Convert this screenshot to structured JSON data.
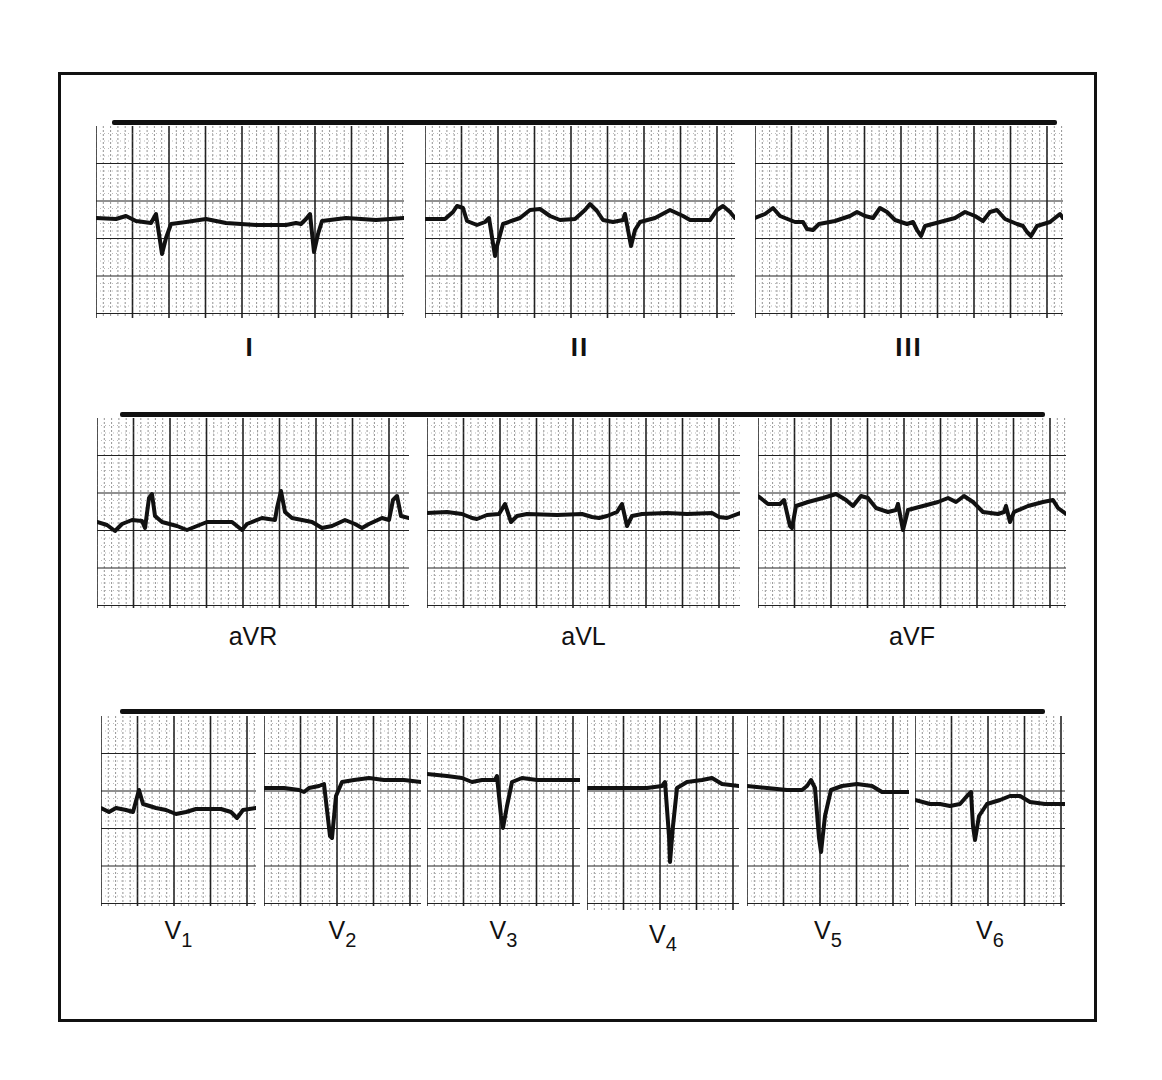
{
  "figure": {
    "rows": [
      {
        "name": "limb-leads",
        "calibration_bar": {
          "x": 112,
          "y": 120,
          "width": 945
        },
        "strips": [
          {
            "lead": "I",
            "label": "I",
            "x": 96,
            "y": 126,
            "w": 308,
            "h": 192,
            "baseline": 218,
            "waveform": "M0,92 L20,93 L30,90 L40,95 L55,97 L60,88 L66,128 L70,112 L75,98 L90,96 L110,93 L130,97 L160,99 L190,99 L200,97 L205,98 L210,93 L214,88 L218,126 L222,108 L226,95 L250,92 L280,94 L308,92"
          },
          {
            "lead": "II",
            "label": "II",
            "x": 425,
            "y": 126,
            "w": 310,
            "h": 192,
            "baseline": 218,
            "waveform": "M0,93 L20,93 L28,86 L32,80 L38,82 L42,95 L52,99 L60,96 L64,92 L70,130 L72,120 L78,98 L95,92 L105,84 L115,83 L125,90 L135,94 L150,93 L160,84 L165,78 L172,85 L178,94 L188,96 L198,94 L200,88 L206,120 L210,104 L215,96 L230,92 L245,84 L258,90 L265,94 L285,94 L292,84 L298,80 L305,86 L310,92"
          },
          {
            "lead": "III",
            "label": "III",
            "x": 755,
            "y": 126,
            "w": 308,
            "h": 192,
            "baseline": 218,
            "waveform": "M0,92 L10,88 L18,82 L25,90 L40,96 L48,96 L52,103 L58,104 L64,98 L80,95 L95,90 L102,86 L110,90 L118,92 L125,82 L132,86 L140,94 L152,98 L158,96 L162,104 L166,110 L170,100 L185,96 L200,92 L210,86 L220,90 L228,95 L235,86 L242,84 L250,93 L262,98 L268,100 L272,106 L276,110 L282,100 L295,96 L305,88 L308,92"
          }
        ]
      },
      {
        "name": "augmented-leads",
        "calibration_bar": {
          "x": 120,
          "y": 412,
          "width": 925
        },
        "strips": [
          {
            "lead": "aVR",
            "label": "aVR",
            "x": 97,
            "y": 418,
            "w": 312,
            "h": 190,
            "baseline": 525,
            "waveform": "M0,104 L10,107 L18,113 L25,106 L35,102 L45,103 L48,110 L52,80 L55,76 L58,98 L65,104 L80,108 L90,112 L100,108 L110,104 L135,104 L145,112 L150,106 L165,100 L178,102 L180,90 L184,73 L188,94 L195,100 L215,104 L225,110 L235,108 L248,102 L258,106 L265,110 L272,106 L285,100 L292,102 L296,82 L300,78 L304,98 L312,100"
          },
          {
            "lead": "aVL",
            "label": "aVL",
            "x": 427,
            "y": 418,
            "w": 313,
            "h": 190,
            "baseline": 513,
            "waveform": "M0,95 L20,94 L35,96 L45,100 L50,101 L60,97 L72,96 L78,86 L84,104 L90,98 L100,96 L130,97 L155,96 L165,99 L172,100 L180,98 L190,94 L195,86 L200,108 L205,98 L215,96 L240,95 L260,96 L285,95 L292,99 L300,100 L313,95"
          },
          {
            "lead": "aVF",
            "label": "aVF",
            "x": 758,
            "y": 418,
            "w": 308,
            "h": 190,
            "baseline": 508,
            "waveform": "M0,78 L10,86 L22,86 L26,82 L32,108 L34,110 L38,88 L50,84 L65,80 L78,76 L88,82 L95,88 L103,78 L110,80 L118,90 L130,94 L138,92 L140,86 L145,112 L150,92 L165,88 L180,84 L190,80 L198,84 L206,78 L215,84 L225,94 L240,96 L246,94 L248,88 L252,104 L256,94 L270,88 L285,84 L295,82 L300,90 L308,96"
          }
        ]
      },
      {
        "name": "precordial-leads",
        "calibration_bar": {
          "x": 120,
          "y": 709,
          "width": 925
        },
        "strips": [
          {
            "lead": "V1",
            "label": "V",
            "subscript": "1",
            "x": 101,
            "y": 716,
            "w": 155,
            "h": 190,
            "baseline": 808,
            "waveform": "M0,92 L8,96 L15,92 L25,94 L32,96 L38,74 L42,88 L55,92 L65,94 L75,98 L85,96 L95,93 L105,93 L120,93 L130,96 L136,102 L142,94 L155,92"
          },
          {
            "lead": "V2",
            "label": "V",
            "subscript": "2",
            "x": 264,
            "y": 716,
            "w": 157,
            "h": 190,
            "baseline": 788,
            "waveform": "M0,72 L20,72 L35,74 L40,76 L45,72 L55,70 L60,68 L66,120 L68,122 L72,80 L78,66 L90,64 L105,62 L120,64 L140,64 L157,66"
          },
          {
            "lead": "V3",
            "label": "V",
            "subscript": "3",
            "x": 427,
            "y": 716,
            "w": 153,
            "h": 190,
            "baseline": 775,
            "waveform": "M0,58 L20,60 L35,62 L45,66 L55,64 L68,64 L70,60 L74,100 L76,112 L80,90 L85,66 L95,62 L110,64 L130,64 L153,64"
          },
          {
            "lead": "V4",
            "label": "V",
            "subscript": "4",
            "x": 587,
            "y": 716,
            "w": 152,
            "h": 194,
            "baseline": 788,
            "waveform": "M0,72 L20,72 L40,72 L60,72 L75,70 L78,66 L82,120 L83,146 L86,110 L90,72 L100,66 L115,64 L125,62 L135,68 L152,70"
          },
          {
            "lead": "V5",
            "label": "V",
            "subscript": "5",
            "x": 747,
            "y": 716,
            "w": 162,
            "h": 190,
            "baseline": 787,
            "waveform": "M0,70 L20,72 L40,74 L55,74 L60,70 L64,64 L68,72 L72,122 L74,136 L78,100 L84,74 L95,70 L110,68 L125,70 L135,76 L162,76"
          },
          {
            "lead": "V6",
            "label": "V",
            "subscript": "6",
            "x": 915,
            "y": 716,
            "w": 150,
            "h": 190,
            "baseline": 800,
            "waveform": "M0,84 L15,88 L25,88 L35,90 L45,88 L52,80 L56,76 L58,110 L60,124 L64,100 L72,88 L85,84 L95,80 L105,80 L115,86 L130,88 L150,88"
          }
        ]
      }
    ],
    "colors": {
      "ink": "#111111",
      "paper": "#ffffff",
      "grid_major": "#222222",
      "grid_minor": "#777777"
    }
  }
}
